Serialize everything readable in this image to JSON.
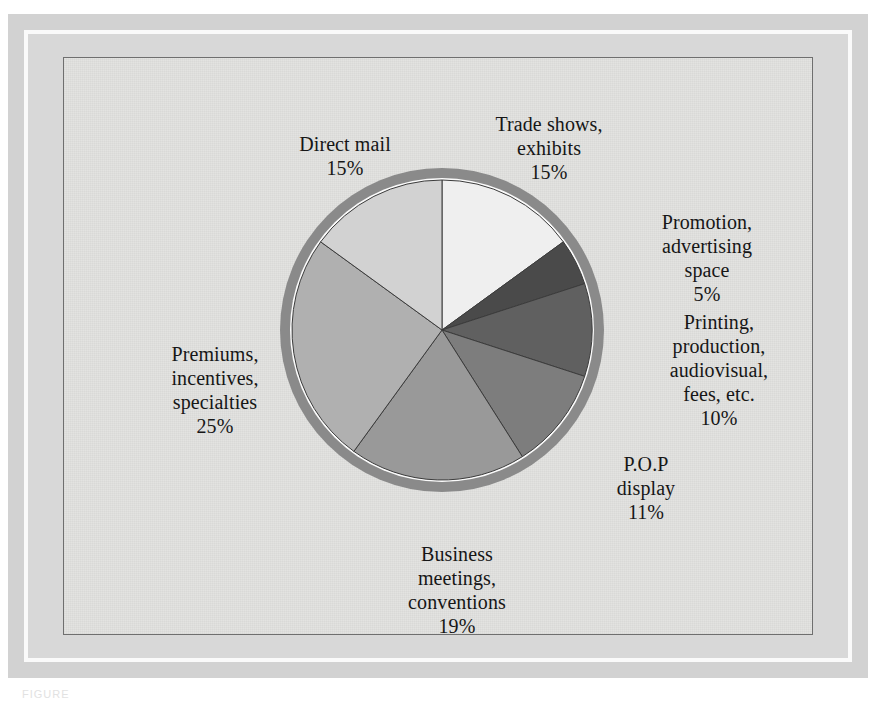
{
  "figure": {
    "caption_partial": "FIGURE",
    "background_color": "#ffffff",
    "panel_color": "#e3e3e1",
    "frame_color": "#d2d2d2",
    "rim_color": "#8a8a8a"
  },
  "chart_data": {
    "type": "pie",
    "title": "",
    "subtitle": "",
    "xlabel": "",
    "ylabel": "",
    "legend_position": "none (labels placed around pie)",
    "grid": false,
    "start_angle_deg": 0,
    "direction": "clockwise",
    "total_percent": 100,
    "categories": [
      "Trade shows, exhibits",
      "Promotion, advertising space",
      "Printing, production, audiovisual, fees, etc.",
      "P.O.P display",
      "Business meetings, conventions",
      "Premiums, incentives, specialties",
      "Direct mail"
    ],
    "values": [
      15,
      5,
      10,
      11,
      19,
      25,
      15
    ],
    "slices": [
      {
        "name": "Trade shows, exhibits",
        "label_lines": "Trade shows,\nexhibits",
        "percent_text": "15%",
        "value": 15,
        "color": "#efefef",
        "start_deg": 0,
        "end_deg": 54
      },
      {
        "name": "Promotion, advertising space",
        "label_lines": "Promotion,\nadvertising\nspace",
        "percent_text": "5%",
        "value": 5,
        "color": "#4a4a4a",
        "start_deg": 54,
        "end_deg": 72
      },
      {
        "name": "Printing, production, audiovisual, fees, etc.",
        "label_lines": "Printing,\nproduction,\naudiovisual,\nfees, etc.",
        "percent_text": "10%",
        "value": 10,
        "color": "#606060",
        "start_deg": 72,
        "end_deg": 108
      },
      {
        "name": "P.O.P display",
        "label_lines": "P.O.P\ndisplay",
        "percent_text": "11%",
        "value": 11,
        "color": "#7d7d7d",
        "start_deg": 108,
        "end_deg": 147.6
      },
      {
        "name": "Business meetings, conventions",
        "label_lines": "Business\nmeetings,\nconventions",
        "percent_text": "19%",
        "value": 19,
        "color": "#999999",
        "start_deg": 147.6,
        "end_deg": 216
      },
      {
        "name": "Premiums, incentives, specialties",
        "label_lines": "Premiums,\nincentives,\nspecialties",
        "percent_text": "25%",
        "value": 25,
        "color": "#b0b0b0",
        "start_deg": 216,
        "end_deg": 306
      },
      {
        "name": "Direct mail",
        "label_lines": "Direct mail",
        "percent_text": "15%",
        "value": 15,
        "color": "#d2d2d2",
        "start_deg": 306,
        "end_deg": 360
      }
    ]
  }
}
